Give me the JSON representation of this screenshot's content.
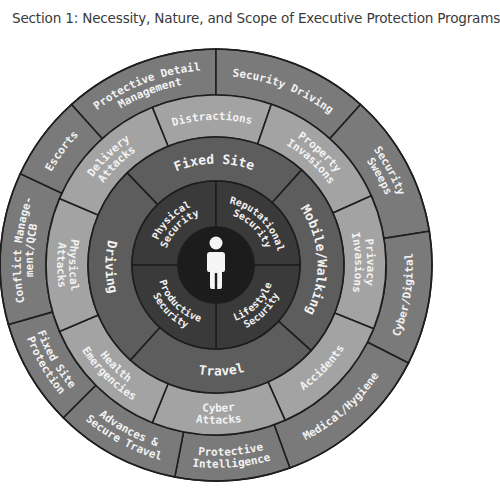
{
  "title": "Section 1: Necessity, Nature, and Scope of Executive Protection Programs",
  "diagram": {
    "center": {
      "x": 216,
      "y": 265
    },
    "colors": {
      "outer_ring": "#7a7a7a",
      "threat_ring": "#a3a3a3",
      "environment_ring": "#5d5d5d",
      "security_ring": "#3a3a3a",
      "core": "#1c1c1c",
      "divider": "#1e1e1e",
      "text": "#f2f2f2",
      "person_icon": "#f5f5f5"
    },
    "core": {
      "icon": "person-icon",
      "radius": 38
    },
    "security_domains": {
      "r_inner": 38,
      "r_outer": 84,
      "items": [
        {
          "label": [
            "Physical",
            "Security"
          ],
          "start": 90,
          "end": 180
        },
        {
          "label": [
            "Reputational",
            "Security"
          ],
          "start": 0,
          "end": 90
        },
        {
          "label": [
            "Lifestyle",
            "Security"
          ],
          "start": -90,
          "end": 0
        },
        {
          "label": [
            "Productive",
            "Security"
          ],
          "start": 180,
          "end": 270
        }
      ]
    },
    "environments": {
      "r_inner": 84,
      "r_outer": 128,
      "items": [
        {
          "label": [
            "Fixed Site"
          ],
          "start": 48,
          "end": 134
        },
        {
          "label": [
            "Mobile/Walking"
          ],
          "start": -42,
          "end": 48
        },
        {
          "label": [
            "Travel"
          ],
          "start": -132,
          "end": -42
        },
        {
          "label": [
            "Driving"
          ],
          "start": 134,
          "end": 228
        }
      ]
    },
    "threats": {
      "r_inner": 128,
      "r_outer": 170,
      "items": [
        {
          "label": [
            "Distractions"
          ],
          "start": 71,
          "end": 112
        },
        {
          "label": [
            "Property",
            "Invasions"
          ],
          "start": 24,
          "end": 71
        },
        {
          "label": [
            "Privacy",
            "Invasions"
          ],
          "start": -22,
          "end": 24
        },
        {
          "label": [
            "Accidents"
          ],
          "start": -66,
          "end": -22
        },
        {
          "label": [
            "Cyber",
            "Attacks"
          ],
          "start": -112,
          "end": -66
        },
        {
          "label": [
            "Health",
            "Emergencies"
          ],
          "start": -157,
          "end": -112
        },
        {
          "label": [
            "Physical",
            "Attacks"
          ],
          "start": 157,
          "end": 203
        },
        {
          "label": [
            "Delivery",
            "Attacks"
          ],
          "start": 112,
          "end": 157
        }
      ]
    },
    "services": {
      "r_inner": 170,
      "r_outer": 216,
      "items": [
        {
          "label": [
            "Protective Detail",
            "Management"
          ],
          "start": 90,
          "end": 132
        },
        {
          "label": [
            "Security Driving"
          ],
          "start": 48,
          "end": 90
        },
        {
          "label": [
            "Security",
            "Sweeps"
          ],
          "start": 9,
          "end": 48
        },
        {
          "label": [
            "Cyber/Digital"
          ],
          "start": -27,
          "end": 9
        },
        {
          "label": [
            "Medical/Hygiene"
          ],
          "start": -70,
          "end": -27
        },
        {
          "label": [
            "Protective",
            "Intelligence"
          ],
          "start": -101,
          "end": -70
        },
        {
          "label": [
            "Advances &",
            "Secure Travel"
          ],
          "start": -135,
          "end": -101
        },
        {
          "label": [
            "Fixed Site",
            "Protection"
          ],
          "start": -164,
          "end": -135
        },
        {
          "label": [
            "Conflict Manage-",
            "ment/QCB"
          ],
          "start": 155,
          "end": 196
        },
        {
          "label": [
            "Escorts"
          ],
          "start": 132,
          "end": 155
        }
      ]
    }
  }
}
